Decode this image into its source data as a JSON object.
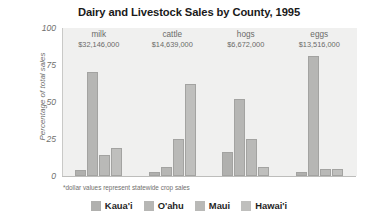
{
  "chart_data": {
    "type": "bar",
    "title": "Dairy and Livestock Sales by County, 1995",
    "xlabel": "",
    "ylabel": "Percentage of total sales",
    "ylim": [
      0,
      100
    ],
    "yticks": [
      100,
      75,
      50,
      25,
      0
    ],
    "grid": false,
    "legend_position": "bottom",
    "footnote": "*dollar values represent statewide crop sales",
    "categories": [
      "milk",
      "cattle",
      "hogs",
      "eggs"
    ],
    "category_values": [
      "$32,146,000",
      "$14,639,000",
      "$6,672,000",
      "$13,516,000"
    ],
    "series": [
      {
        "name": "Kaua'i",
        "color": "#b0b0ae",
        "values": [
          4,
          3,
          16,
          3
        ]
      },
      {
        "name": "O'ahu",
        "color": "#b6b6b4",
        "values": [
          70,
          6,
          52,
          81
        ]
      },
      {
        "name": "Maui",
        "color": "#b9b9b7",
        "values": [
          14,
          25,
          25,
          5
        ]
      },
      {
        "name": "Hawai'i",
        "color": "#bfbfbd",
        "values": [
          19,
          62,
          6,
          5
        ]
      }
    ]
  }
}
